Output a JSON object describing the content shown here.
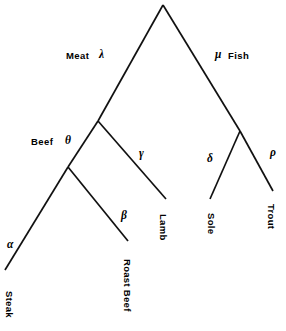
{
  "diagram": {
    "type": "binary-tree",
    "title": "",
    "background_color": "#ffffff",
    "line_color": "#111111",
    "text_color": "#000000",
    "width": 286,
    "height": 331,
    "internal_labels": {
      "meat": "Meat",
      "fish": "Fish",
      "beef": "Beef"
    },
    "greek_labels": {
      "lambda": "λ",
      "mu": "μ",
      "theta": "θ",
      "gamma": "γ",
      "beta": "β",
      "alpha": "α",
      "delta": "δ",
      "rho": "ρ"
    },
    "leaf_labels": {
      "steak": "Steak",
      "roast_beef": "Roast Beef",
      "lamb": "Lamb",
      "sole": "Sole",
      "trout": "Trout"
    },
    "nodes": [
      {
        "id": "root",
        "x": 163,
        "y": 5,
        "kind": "internal",
        "label": ""
      },
      {
        "id": "meat",
        "x": 98,
        "y": 121,
        "kind": "internal",
        "label": "Meat"
      },
      {
        "id": "fish",
        "x": 240,
        "y": 131,
        "kind": "internal",
        "label": "Fish"
      },
      {
        "id": "beef",
        "x": 68,
        "y": 167,
        "kind": "internal",
        "label": "Beef"
      },
      {
        "id": "steak",
        "x": 5,
        "y": 270,
        "kind": "leaf",
        "label": "Steak"
      },
      {
        "id": "roast",
        "x": 128,
        "y": 241,
        "kind": "leaf",
        "label": "Roast Beef"
      },
      {
        "id": "lamb",
        "x": 166,
        "y": 199,
        "kind": "leaf",
        "label": "Lamb"
      },
      {
        "id": "sole",
        "x": 210,
        "y": 199,
        "kind": "leaf",
        "label": "Sole"
      },
      {
        "id": "trout",
        "x": 273,
        "y": 191,
        "kind": "leaf",
        "label": "Trout"
      }
    ],
    "edges": [
      {
        "id": "root-meat",
        "from": "root",
        "to": "meat",
        "label": "λ"
      },
      {
        "id": "root-fish",
        "from": "root",
        "to": "fish",
        "label": "μ"
      },
      {
        "id": "meat-beef",
        "from": "meat",
        "to": "beef",
        "label": "θ"
      },
      {
        "id": "meat-lamb",
        "from": "meat",
        "to": "lamb",
        "label": "γ"
      },
      {
        "id": "beef-steak",
        "from": "beef",
        "to": "steak",
        "label": "α"
      },
      {
        "id": "beef-roast",
        "from": "beef",
        "to": "roast",
        "label": "β"
      },
      {
        "id": "fish-sole",
        "from": "fish",
        "to": "sole",
        "label": "δ"
      },
      {
        "id": "fish-trout",
        "from": "fish",
        "to": "trout",
        "label": "ρ"
      }
    ]
  }
}
